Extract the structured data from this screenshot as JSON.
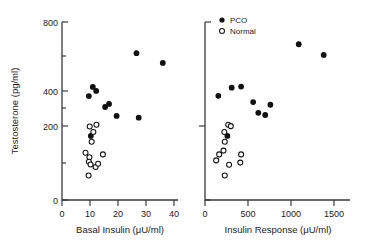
{
  "figure": {
    "background": "#ffffff",
    "ink_color": "#111111",
    "n_panels": 2
  },
  "legend": {
    "position": "top-right-panel",
    "entries": [
      {
        "label": "PCO",
        "marker": "filled-circle",
        "color": "#111111"
      },
      {
        "label": "Normal",
        "marker": "open-circle",
        "color": "#111111"
      }
    ]
  },
  "chart_data": [
    {
      "type": "scatter",
      "panel": "left",
      "title": "",
      "xlabel": "Basal Insulin  (μU/ml)",
      "ylabel": "Testosterone  (pg/ml)",
      "xlim": [
        0,
        40
      ],
      "ylim": [
        0,
        800
      ],
      "xticks": [
        0,
        10,
        20,
        30,
        40
      ],
      "xticklabels": [
        "0",
        "10",
        "20",
        "30",
        "40"
      ],
      "yticks": [
        0,
        200,
        400,
        800
      ],
      "yticklabels": [
        "0",
        "200",
        "400",
        "800"
      ],
      "y_minor_ticks": [
        100,
        300,
        500,
        600,
        700
      ],
      "grid": false,
      "series": [
        {
          "name": "PCO",
          "marker": "filled-circle",
          "color": "#111111",
          "points": [
            [
              9.6,
              467
            ],
            [
              11.0,
              508
            ],
            [
              12.2,
              490
            ],
            [
              15.4,
              418
            ],
            [
              16.8,
              432
            ],
            [
              19.5,
              378
            ],
            [
              26.6,
              660
            ],
            [
              27.4,
              370
            ],
            [
              36.0,
              616
            ],
            [
              10.3,
              288
            ]
          ]
        },
        {
          "name": "Normal",
          "marker": "open-circle",
          "color": "#111111",
          "points": [
            [
              9.9,
              330
            ],
            [
              12.3,
              338
            ],
            [
              11.2,
              306
            ],
            [
              10.6,
              262
            ],
            [
              8.4,
              212
            ],
            [
              9.8,
              192
            ],
            [
              9.6,
              172
            ],
            [
              10.2,
              160
            ],
            [
              12.0,
              148
            ],
            [
              14.6,
              205
            ],
            [
              12.9,
              163
            ],
            [
              9.5,
              110
            ]
          ]
        }
      ]
    },
    {
      "type": "scatter",
      "panel": "right",
      "title": "",
      "xlabel": "Insulin Response  (μU/ml)",
      "ylabel": "Testosterone  (pg/ml)",
      "xlim": [
        0,
        1600
      ],
      "ylim": [
        0,
        800
      ],
      "xticks": [
        0,
        500,
        1000,
        1500
      ],
      "xticklabels": [
        "0",
        "500",
        "1000",
        "1500"
      ],
      "yticks": [
        0,
        200,
        400,
        800
      ],
      "yticklabels": [
        "",
        "",
        "",
        ""
      ],
      "y_minor_ticks": [
        400
      ],
      "grid": false,
      "series": [
        {
          "name": "PCO",
          "marker": "filled-circle",
          "color": "#111111",
          "points": [
            [
              155,
              468
            ],
            [
              310,
              505
            ],
            [
              420,
              510
            ],
            [
              560,
              440
            ],
            [
              620,
              392
            ],
            [
              700,
              382
            ],
            [
              760,
              428
            ],
            [
              1090,
              700
            ],
            [
              1380,
              652
            ],
            [
              260,
              288
            ]
          ]
        },
        {
          "name": "Normal",
          "marker": "open-circle",
          "color": "#111111",
          "points": [
            [
              270,
              338
            ],
            [
              300,
              332
            ],
            [
              225,
              306
            ],
            [
              230,
              262
            ],
            [
              215,
              222
            ],
            [
              165,
              205
            ],
            [
              420,
              205
            ],
            [
              130,
              178
            ],
            [
              410,
              168
            ],
            [
              280,
              158
            ],
            [
              230,
              110
            ]
          ]
        }
      ]
    }
  ]
}
